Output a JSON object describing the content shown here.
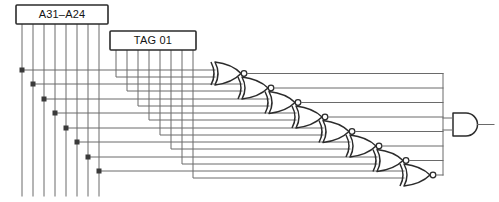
{
  "diagram": {
    "type": "logic-circuit-schematic",
    "background_color": "#ffffff",
    "wire_color": "#6a6a6a",
    "gate_outline_color": "#2b2b2b",
    "label_color": "#141414"
  },
  "boxes": [
    {
      "id": "address-bus",
      "label": "A31–A24",
      "x": 16,
      "y": 5,
      "width": 92,
      "height": 19,
      "pin_count": 8
    },
    {
      "id": "tag-register",
      "label": "TAG 01",
      "x": 110,
      "y": 31,
      "width": 86,
      "height": 19,
      "pin_count": 8
    }
  ],
  "gates": {
    "xnor": {
      "count": 8,
      "symbol_name": "xnor-gate",
      "inputs_per_gate": 2,
      "has_output_bubble": true,
      "positions": [
        {
          "index": 1,
          "x": 214,
          "y": 69
        },
        {
          "index": 2,
          "x": 241,
          "y": 84
        },
        {
          "index": 3,
          "x": 268,
          "y": 99
        },
        {
          "index": 4,
          "x": 295,
          "y": 113
        },
        {
          "index": 5,
          "x": 322,
          "y": 128
        },
        {
          "index": 6,
          "x": 349,
          "y": 142
        },
        {
          "index": 7,
          "x": 376,
          "y": 157
        },
        {
          "index": 8,
          "x": 403,
          "y": 172
        }
      ]
    },
    "and": {
      "count": 1,
      "symbol_name": "and-gate",
      "inputs_per_gate": 8,
      "has_output_bubble": false,
      "position": {
        "x": 456,
        "y": 124
      }
    }
  },
  "buses": {
    "address_vertical_lines": 8,
    "tag_vertical_lines": 8,
    "junction_dot_count": 8,
    "output_collector_x": 442
  },
  "legend": {
    "xnor_icon_name": "xnor-gate-icon",
    "and_icon_name": "and-gate-icon",
    "junction_icon_name": "junction-dot-icon"
  }
}
